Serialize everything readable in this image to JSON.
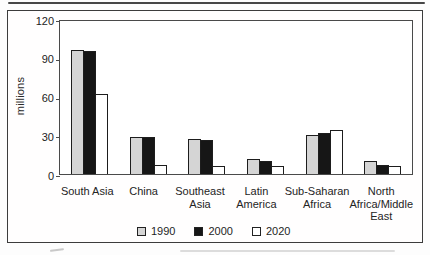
{
  "page": {
    "background": "#fdfdfd",
    "frame_border_color": "#3c3c3c",
    "artifacts": [
      "top-scan-rule",
      "bottom-scan-smudge"
    ]
  },
  "chart_data": {
    "type": "bar",
    "title": "",
    "ylabel": "millions",
    "xlabel": "",
    "ylim": [
      0,
      120
    ],
    "yticks": [
      120,
      90,
      60,
      30,
      0
    ],
    "grid": false,
    "legend_position": "bottom",
    "bar_outline_color": "#1d1d1d",
    "plot_border_color": "#4a4a4a",
    "categories": [
      "South Asia",
      "China",
      "Southeast Asia",
      "Latin America",
      "Sub-Saharan Africa",
      "North Africa/Middle East"
    ],
    "category_lines": [
      [
        "South Asia"
      ],
      [
        "China"
      ],
      [
        "Southeast",
        "Asia"
      ],
      [
        "Latin",
        "America"
      ],
      [
        "Sub-Saharan",
        "Africa"
      ],
      [
        "North",
        "Africa/Middle",
        "East"
      ]
    ],
    "series": [
      {
        "name": "1990",
        "color": "#d5d5d5",
        "values": [
          96,
          29,
          27,
          12,
          30,
          10
        ]
      },
      {
        "name": "2000",
        "color": "#161616",
        "values": [
          95,
          29,
          26,
          10,
          32,
          7
        ]
      },
      {
        "name": "2020",
        "color": "#ffffff",
        "values": [
          62,
          7,
          6,
          6,
          34,
          6
        ]
      }
    ]
  }
}
